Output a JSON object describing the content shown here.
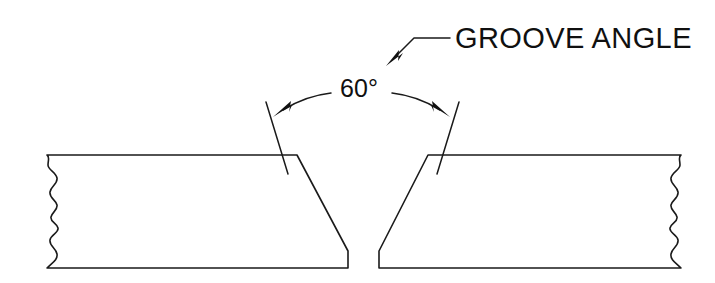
{
  "drawing": {
    "title": "Groove Angle — V-Groove Butt Joint Preparation",
    "background_color": "#ffffff",
    "line_color": "#1a1a1a",
    "text_color": "#101010",
    "width": 715,
    "height": 283
  },
  "annotations": {
    "groove_angle_label": "GROOVE ANGLE",
    "angle_dimension": "60°",
    "angle_value": 60,
    "angle_unit": "degrees"
  },
  "icons": {
    "leader_arrow": "leader-arrow-icon",
    "dimension_arrow_left": "dimension-arrow-left-icon",
    "dimension_arrow_right": "dimension-arrow-right-icon",
    "break_line_left": "break-line-icon",
    "break_line_right": "break-line-icon"
  },
  "geometry": {
    "left_plate": {
      "name": "left-plate",
      "top_y": 155,
      "bottom_y": 268,
      "left_x": 45,
      "bevel_top_x": 297,
      "root_face_x": 348,
      "root_face_top_y": 252
    },
    "right_plate": {
      "name": "right-plate",
      "top_y": 155,
      "bottom_y": 268,
      "right_x": 683,
      "bevel_top_x": 428,
      "root_face_x": 379,
      "root_face_top_y": 252
    },
    "root_gap": {
      "left_x": 348,
      "right_x": 379,
      "width": 31
    },
    "bevel_angle_each_side": 30
  }
}
